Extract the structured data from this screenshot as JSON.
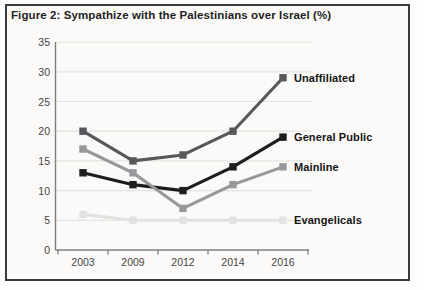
{
  "figure": {
    "title": "Figure 2: Sympathize with the Palestinians over Israel (%)"
  },
  "chart_data": {
    "type": "line",
    "title": "Figure 2: Sympathize with the Palestinians over Israel (%)",
    "categories": [
      "2003",
      "2009",
      "2012",
      "2014",
      "2016"
    ],
    "series": [
      {
        "name": "Unaffiliated",
        "values": [
          20,
          15,
          16,
          20,
          29
        ],
        "color": "#57585b"
      },
      {
        "name": "General Public",
        "values": [
          13,
          11,
          10,
          14,
          19
        ],
        "color": "#1d1d1f"
      },
      {
        "name": "Mainline",
        "values": [
          17,
          13,
          7,
          11,
          14
        ],
        "color": "#97989b"
      },
      {
        "name": "Evangelicals",
        "values": [
          6,
          5,
          5,
          5,
          5
        ],
        "color": "#e2e2e0"
      }
    ],
    "xlabel": "",
    "ylabel": "",
    "ylim": [
      0,
      35
    ],
    "yticks": [
      0,
      5,
      10,
      15,
      20,
      25,
      30,
      35
    ],
    "grid": true,
    "legend_position": "right-of-last-point",
    "colors": {
      "grid_line": "#e4e3df",
      "axis_line": "#7e7e7e",
      "tick_text": "#454545",
      "label_text": "#141414",
      "frame_border": "#3a3a3a",
      "paper_background": "#fbfaf8"
    }
  }
}
